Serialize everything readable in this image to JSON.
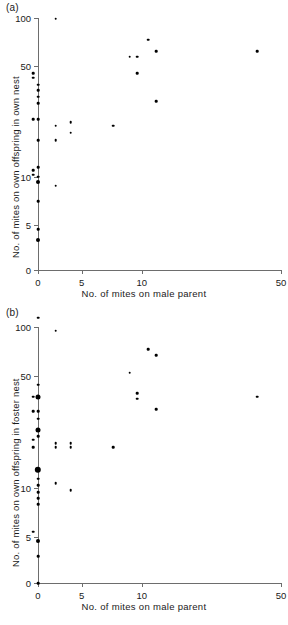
{
  "figure": {
    "background": "#ffffff",
    "point_color": "#000000",
    "axis_color": "#6d6d6d"
  },
  "panels": [
    {
      "id": "a",
      "label": "(a)",
      "xlabel": "No. of mites on male parent",
      "ylabel": "No. of mites on own offspring in own nest"
    },
    {
      "id": "b",
      "label": "(b)",
      "xlabel": "No. of mites on male parent",
      "ylabel": "No. of mites on own offspring in foster nest"
    }
  ],
  "chart_data": [
    {
      "type": "scatter",
      "panel": "a",
      "title": "(a)",
      "xlabel": "No. of mites on male parent",
      "ylabel": "No. of mites on own offspring in own nest",
      "xticks": [
        0,
        5,
        10,
        50
      ],
      "xticklabels": [
        "0",
        "5",
        "10",
        "50"
      ],
      "yticks": [
        0,
        5,
        10,
        50,
        100
      ],
      "yticklabels": [
        "0",
        "5",
        "10",
        "50",
        "100"
      ],
      "xscale": "log-like (0 then log)",
      "yscale": "log-like (0 then log)",
      "grid": false,
      "legend": false,
      "points": [
        {
          "x": 0,
          "y": 38,
          "n": 1
        },
        {
          "x": 0,
          "y": 35,
          "n": 1
        },
        {
          "x": 0,
          "y": 32,
          "n": 1
        },
        {
          "x": 0,
          "y": 29,
          "n": 1
        },
        {
          "x": 0,
          "y": 23,
          "n": 1
        },
        {
          "x": 0,
          "y": 17,
          "n": 1
        },
        {
          "x": 0,
          "y": 11.5,
          "n": 1
        },
        {
          "x": 0,
          "y": 10,
          "n": 1
        },
        {
          "x": 0,
          "y": 9.3,
          "n": 2
        },
        {
          "x": 0,
          "y": 7,
          "n": 1
        },
        {
          "x": 0,
          "y": 4.7,
          "n": 1
        },
        {
          "x": 0,
          "y": 4.0,
          "n": 2
        },
        {
          "x": 0,
          "y": 1.3,
          "n": 1
        },
        {
          "x": 1.9,
          "y": 73,
          "n": 1
        },
        {
          "x": 2.85,
          "y": 45,
          "n": 1
        },
        {
          "x": 2.85,
          "y": 42,
          "n": 1
        },
        {
          "x": 2.85,
          "y": 23,
          "n": 1
        },
        {
          "x": 2.85,
          "y": 11.0,
          "n": 1
        },
        {
          "x": 2.85,
          "y": 10.3,
          "n": 1
        },
        {
          "x": 3.7,
          "y": 99,
          "n": 1
        },
        {
          "x": 3.7,
          "y": 21,
          "n": 1
        },
        {
          "x": 3.7,
          "y": 17,
          "n": 1
        },
        {
          "x": 3.7,
          "y": 8.8,
          "n": 1
        },
        {
          "x": 4.4,
          "y": 22,
          "n": 1
        },
        {
          "x": 4.4,
          "y": 19,
          "n": 1
        },
        {
          "x": 7.2,
          "y": 21,
          "n": 1
        },
        {
          "x": 8.7,
          "y": 57,
          "n": 1
        },
        {
          "x": 9.5,
          "y": 57,
          "n": 1
        },
        {
          "x": 9.5,
          "y": 45,
          "n": 1
        },
        {
          "x": 10.8,
          "y": 73,
          "n": 1
        },
        {
          "x": 11.8,
          "y": 62,
          "n": 1
        },
        {
          "x": 11.8,
          "y": 30,
          "n": 1
        },
        {
          "x": 38,
          "y": 62,
          "n": 1
        }
      ]
    },
    {
      "type": "scatter",
      "panel": "b",
      "title": "(b)",
      "xlabel": "No. of mites on male parent",
      "ylabel": "No. of mites on own offspring in foster nest",
      "xticks": [
        0,
        5,
        10,
        50
      ],
      "xticklabels": [
        "0",
        "5",
        "10",
        "50"
      ],
      "yticks": [
        0,
        5,
        10,
        50,
        100
      ],
      "yticklabels": [
        "0",
        "5",
        "10",
        "50",
        "100"
      ],
      "xscale": "log-like (0 then log)",
      "yscale": "log-like (0 then log)",
      "grid": false,
      "legend": false,
      "points": [
        {
          "x": 0,
          "y": 44,
          "n": 1
        },
        {
          "x": 0,
          "y": 37,
          "n": 3
        },
        {
          "x": 0,
          "y": 30,
          "n": 1
        },
        {
          "x": 0,
          "y": 27,
          "n": 1
        },
        {
          "x": 0,
          "y": 23,
          "n": 3
        },
        {
          "x": 0,
          "y": 21,
          "n": 1
        },
        {
          "x": 0,
          "y": 13,
          "n": 5
        },
        {
          "x": 0,
          "y": 11.5,
          "n": 1
        },
        {
          "x": 0,
          "y": 10.5,
          "n": 1
        },
        {
          "x": 0,
          "y": 9.5,
          "n": 1
        },
        {
          "x": 0,
          "y": 8.7,
          "n": 1
        },
        {
          "x": 0,
          "y": 8.0,
          "n": 1
        },
        {
          "x": 0,
          "y": 4.7,
          "n": 2
        },
        {
          "x": 0,
          "y": 3.8,
          "n": 1
        },
        {
          "x": 0,
          "y": 0,
          "n": 1
        },
        {
          "x": 1.9,
          "y": 63,
          "n": 1
        },
        {
          "x": 2.85,
          "y": 37,
          "n": 1
        },
        {
          "x": 2.85,
          "y": 30,
          "n": 1
        },
        {
          "x": 2.85,
          "y": 20,
          "n": 1
        },
        {
          "x": 2.85,
          "y": 18,
          "n": 1
        },
        {
          "x": 2.85,
          "y": 5.4,
          "n": 1
        },
        {
          "x": 3.7,
          "y": 95,
          "n": 1
        },
        {
          "x": 3.7,
          "y": 19,
          "n": 1
        },
        {
          "x": 3.7,
          "y": 18,
          "n": 1
        },
        {
          "x": 3.7,
          "y": 10.8,
          "n": 1
        },
        {
          "x": 4.4,
          "y": 19,
          "n": 1
        },
        {
          "x": 4.4,
          "y": 18,
          "n": 1
        },
        {
          "x": 4.4,
          "y": 9.7,
          "n": 1
        },
        {
          "x": 7.2,
          "y": 18,
          "n": 1
        },
        {
          "x": 8.7,
          "y": 52,
          "n": 1
        },
        {
          "x": 9.5,
          "y": 39,
          "n": 1
        },
        {
          "x": 9.5,
          "y": 36,
          "n": 1
        },
        {
          "x": 10.8,
          "y": 73,
          "n": 1
        },
        {
          "x": 11.8,
          "y": 67,
          "n": 1
        },
        {
          "x": 11.8,
          "y": 31,
          "n": 1
        },
        {
          "x": 38,
          "y": 37,
          "n": 1
        }
      ]
    }
  ]
}
